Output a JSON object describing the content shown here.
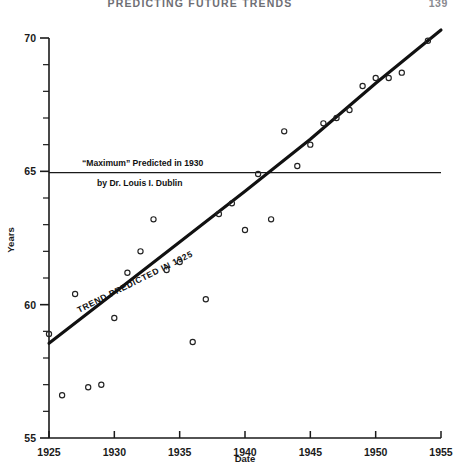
{
  "page": {
    "running_head": "PREDICTING FUTURE TRENDS",
    "page_number": "139"
  },
  "annotations": {
    "max_line_1": "“Maximum” Predicted in 1930",
    "max_line_2": "by Dr. Louis I. Dublin",
    "trend_label": "TREND PREDICTED IN 1925"
  },
  "axes": {
    "x_title": "Date",
    "y_title": "Years",
    "x_ticks": [
      "1925",
      "1930",
      "1935",
      "1940",
      "1945",
      "1950",
      "1955"
    ],
    "y_ticks": [
      "70",
      "65",
      "60",
      "55"
    ]
  },
  "chart_data": {
    "type": "scatter",
    "title": "PREDICTING FUTURE TRENDS",
    "xlabel": "Date",
    "ylabel": "Years",
    "xlim": [
      1925,
      1955
    ],
    "ylim": [
      55,
      70
    ],
    "x_tick_values": [
      1925,
      1930,
      1935,
      1940,
      1945,
      1950,
      1955
    ],
    "y_tick_values": [
      55,
      60,
      65,
      70
    ],
    "x_minor_step": 1,
    "y_minor_step": 1,
    "grid": false,
    "legend": null,
    "series": [
      {
        "name": "Observed life expectancy",
        "marker": "open-circle",
        "x": [
          1925,
          1926,
          1927,
          1928,
          1929,
          1930,
          1931,
          1932,
          1933,
          1934,
          1935,
          1936,
          1937,
          1938,
          1939,
          1940,
          1941,
          1942,
          1943,
          1944,
          1945,
          1946,
          1947,
          1948,
          1949,
          1950,
          1951,
          1952,
          1954
        ],
        "y": [
          58.9,
          56.6,
          60.4,
          56.9,
          57.0,
          59.5,
          61.2,
          62.0,
          63.2,
          61.3,
          61.6,
          58.6,
          60.2,
          63.4,
          63.8,
          62.8,
          64.9,
          63.2,
          66.5,
          65.2,
          66.0,
          66.8,
          67.0,
          67.3,
          68.2,
          68.5,
          68.5,
          68.7,
          69.9
        ]
      },
      {
        "name": "TREND PREDICTED IN 1925",
        "marker": "none",
        "line": "solid-thick",
        "x": [
          1925,
          1930,
          1935,
          1940,
          1945,
          1950,
          1953,
          1955
        ],
        "y": [
          58.55,
          60.45,
          62.35,
          64.25,
          66.2,
          68.3,
          69.5,
          70.3
        ]
      },
      {
        "name": "“Maximum” Predicted in 1930 by Dr. Louis I. Dublin",
        "marker": "none",
        "line": "solid-thin-horizontal",
        "x": [
          1925,
          1955
        ],
        "y": [
          64.95,
          64.95
        ]
      }
    ]
  },
  "colors": {
    "ink": "#111111",
    "axis": "#1a1a1a",
    "header": "#6e6e74"
  }
}
